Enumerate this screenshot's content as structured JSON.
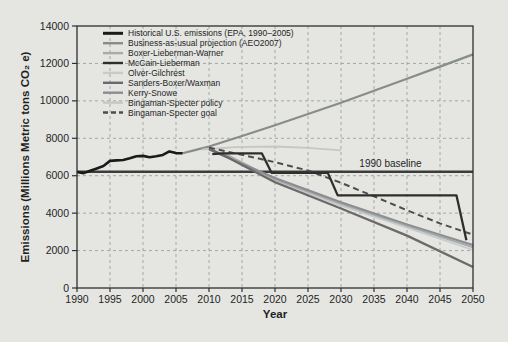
{
  "chart_data": {
    "type": "line",
    "title": "",
    "xlabel": "Year",
    "ylabel": "Emissions (Millions Metric tons CO₂ e)",
    "xlim": [
      1990,
      2050
    ],
    "ylim": [
      0,
      14000
    ],
    "xticks": [
      1990,
      1995,
      2000,
      2005,
      2010,
      2015,
      2020,
      2025,
      2030,
      2035,
      2040,
      2045,
      2050
    ],
    "yticks": [
      0,
      2000,
      4000,
      6000,
      8000,
      10000,
      12000,
      14000
    ],
    "grid": true,
    "legend_position": "top-left",
    "background": "#e5e6e2",
    "frame_color": "#2f2f2f",
    "grid_color": "#9aa09c",
    "baseline": {
      "label": "1990 baseline",
      "value": 6215,
      "color": "#3c3c3c",
      "label_x": 2037.5,
      "label_y": 6480
    },
    "series": [
      {
        "key": "historical",
        "name": "Historical U.S. emissions (EPA, 1990–2005)",
        "color": "#1a1a1a",
        "width": 2.6,
        "dash": null,
        "points": [
          [
            1990,
            6200
          ],
          [
            1991,
            6140
          ],
          [
            1992,
            6270
          ],
          [
            1993,
            6390
          ],
          [
            1994,
            6520
          ],
          [
            1995,
            6790
          ],
          [
            1996,
            6820
          ],
          [
            1997,
            6840
          ],
          [
            1998,
            6930
          ],
          [
            1999,
            7040
          ],
          [
            2000,
            7060
          ],
          [
            2001,
            6990
          ],
          [
            2002,
            7040
          ],
          [
            2003,
            7110
          ],
          [
            2004,
            7300
          ],
          [
            2005,
            7210
          ],
          [
            2006,
            7200
          ]
        ]
      },
      {
        "key": "bau",
        "name": "Business-as-usual projection (AEO2007)",
        "color": "#878d87",
        "width": 2.2,
        "dash": null,
        "points": [
          [
            2006,
            7200
          ],
          [
            2008,
            7380
          ],
          [
            2010,
            7560
          ],
          [
            2015,
            8120
          ],
          [
            2020,
            8700
          ],
          [
            2025,
            9300
          ],
          [
            2030,
            9900
          ],
          [
            2035,
            10540
          ],
          [
            2040,
            11180
          ],
          [
            2045,
            11830
          ],
          [
            2050,
            12480
          ]
        ]
      },
      {
        "key": "boxer_lieberman_warner",
        "name": "Boxer-Lieberman-Warner",
        "color": "#a6aca9",
        "width": 2.0,
        "dash": null,
        "points": [
          [
            2012,
            7250
          ],
          [
            2020,
            5800
          ],
          [
            2030,
            4500
          ],
          [
            2040,
            3320
          ],
          [
            2050,
            2180
          ]
        ]
      },
      {
        "key": "mccain_lieberman",
        "name": "McCain-Lieberman",
        "color": "#312d2e",
        "width": 2.3,
        "dash": null,
        "points": [
          [
            2010.5,
            7150
          ],
          [
            2012,
            7200
          ],
          [
            2018,
            7200
          ],
          [
            2019.5,
            6150
          ],
          [
            2028,
            6150
          ],
          [
            2029.5,
            4950
          ],
          [
            2047.5,
            4950
          ],
          [
            2049,
            2550
          ]
        ]
      },
      {
        "key": "olver_gilchrest",
        "name": "Olver-Gilchrest",
        "color": "#c7cbc7",
        "width": 1.8,
        "dash": null,
        "points": [
          [
            2012,
            7150
          ],
          [
            2020,
            5700
          ],
          [
            2030,
            4400
          ],
          [
            2040,
            3220
          ],
          [
            2050,
            2030
          ]
        ]
      },
      {
        "key": "sanders_boxer_waxman",
        "name": "Sanders-Boxer/Waxman",
        "color": "#6d696a",
        "width": 2.3,
        "dash": null,
        "points": [
          [
            2010,
            7450
          ],
          [
            2013,
            6950
          ],
          [
            2020,
            5650
          ],
          [
            2030,
            4250
          ],
          [
            2040,
            2800
          ],
          [
            2050,
            1120
          ]
        ]
      },
      {
        "key": "kerry_snowe",
        "name": "Kerry-Snowe",
        "color": "#8c8c94",
        "width": 2.0,
        "dash": null,
        "points": [
          [
            2010,
            7400
          ],
          [
            2020,
            5880
          ],
          [
            2030,
            4580
          ],
          [
            2040,
            3400
          ],
          [
            2050,
            2300
          ]
        ]
      },
      {
        "key": "bingaman_specter_policy",
        "name": "Bingaman-Specter policy",
        "color": "#c4c8c2",
        "width": 1.8,
        "dash": null,
        "points": [
          [
            2009,
            7400
          ],
          [
            2014,
            7530
          ],
          [
            2020,
            7560
          ],
          [
            2025,
            7490
          ],
          [
            2030,
            7360
          ]
        ]
      },
      {
        "key": "bingaman_specter_goal",
        "name": "Bingaman-Specter goal",
        "color": "#4d4d4d",
        "width": 2.0,
        "dash": "6 4",
        "points": [
          [
            2010,
            7500
          ],
          [
            2015,
            7120
          ],
          [
            2020,
            6720
          ],
          [
            2025,
            6280
          ],
          [
            2030,
            5620
          ],
          [
            2035,
            4900
          ],
          [
            2040,
            4150
          ],
          [
            2045,
            3450
          ],
          [
            2050,
            2850
          ]
        ]
      }
    ]
  }
}
